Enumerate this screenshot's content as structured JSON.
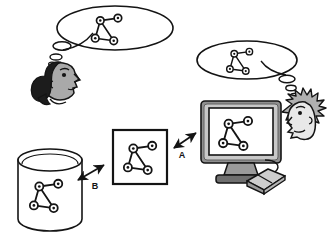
{
  "figure": {
    "type": "conceptual-diagram",
    "background_color": "#ffffff",
    "ink_color": "#141414"
  },
  "graph": {
    "name": "four-node-graph",
    "node_count": 4,
    "edge_count": 4,
    "node_labels": [
      "1",
      "2",
      "3",
      "4"
    ],
    "nodes": [
      {
        "id": "1",
        "x": 0.34,
        "y": 0.3
      },
      {
        "id": "2",
        "x": 0.76,
        "y": 0.24
      },
      {
        "id": "3",
        "x": 0.22,
        "y": 0.72
      },
      {
        "id": "4",
        "x": 0.66,
        "y": 0.78
      }
    ],
    "edges": [
      {
        "from": "1",
        "to": "2"
      },
      {
        "from": "1",
        "to": "3"
      },
      {
        "from": "1",
        "to": "4"
      },
      {
        "from": "3",
        "to": "4"
      }
    ]
  },
  "elements": {
    "left_head": {
      "name": "person-left",
      "description": "cartoon head with dark hair facing right"
    },
    "right_head": {
      "name": "person-right",
      "description": "cartoon head with spiky gray hair facing left"
    },
    "left_bubble": {
      "name": "thought-bubble-left",
      "contains": "four-node-graph"
    },
    "right_bubble": {
      "name": "thought-bubble-right",
      "contains": "four-node-graph"
    },
    "database": {
      "name": "database-cylinder",
      "contains": "four-node-graph"
    },
    "drawing_box": {
      "name": "graph-drawing-box",
      "contains": "four-node-graph"
    },
    "monitor": {
      "name": "computer-monitor",
      "contains": "four-node-graph"
    },
    "mouse": {
      "name": "computer-mouse"
    }
  },
  "arrows": [
    {
      "id": "A",
      "label": "A",
      "name": "arrow-a",
      "direction": "bidirectional",
      "from": "graph-drawing-box",
      "to": "computer-monitor"
    },
    {
      "id": "B",
      "label": "B",
      "name": "arrow-b",
      "direction": "bidirectional",
      "from": "database-cylinder",
      "to": "graph-drawing-box"
    }
  ],
  "palette": {
    "ink": "#141414",
    "white": "#ffffff",
    "hair_dark": "#1c1c1c",
    "skin_gray": "#a9a9a9",
    "skin_light": "#cfcfcf",
    "monitor_body": "#8f8f8f",
    "monitor_dark": "#606060",
    "monitor_light": "#c8c8c8",
    "mouse_gray": "#b5b5b5",
    "hair_gray": "#b0b0b0"
  }
}
